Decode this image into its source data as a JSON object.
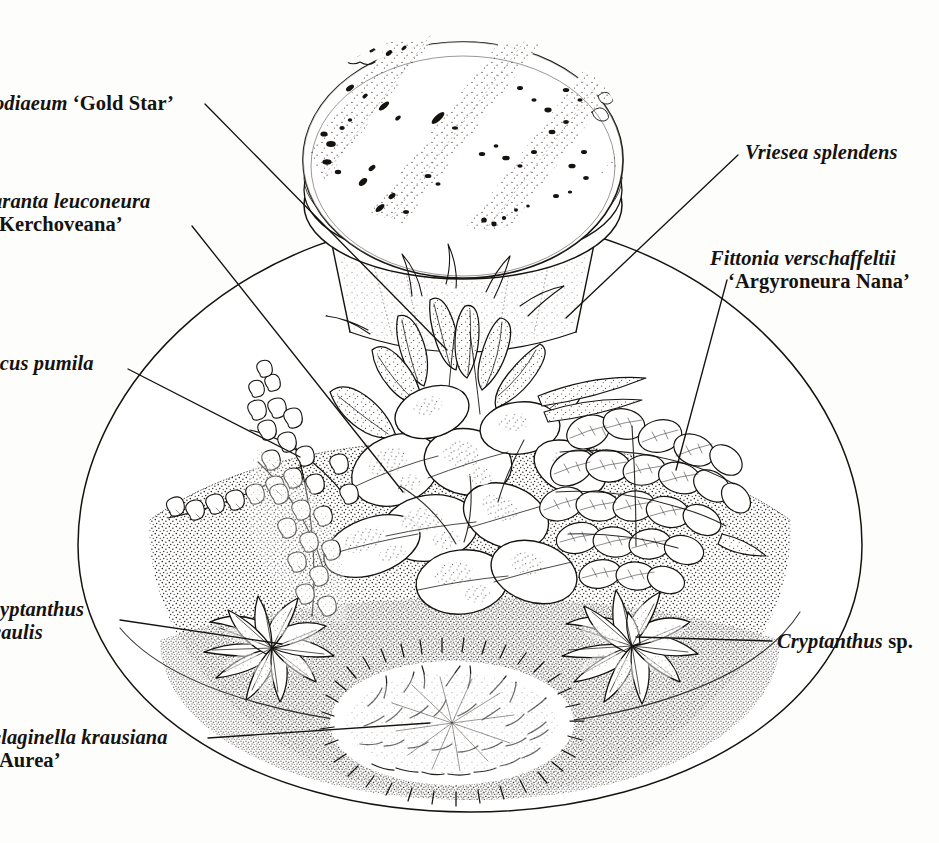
{
  "figure": {
    "kind": "botanical-line-illustration",
    "background_color": "#fdfdfc",
    "ink_color": "#16130f",
    "width": 939,
    "height": 843
  },
  "labels": [
    {
      "id": "codiaeum",
      "name": "label-codiaeum-gold-star",
      "genus_species": "odiaeum",
      "cultivar": "‘Gold Star’",
      "full_text": "odiaeum ‘Gold Star’",
      "truncated_left": true,
      "side": "left",
      "leader_from": [
        205,
        104
      ],
      "leader_to": [
        447,
        350
      ]
    },
    {
      "id": "maranta",
      "name": "label-maranta-leuconeura-kerchoveana",
      "genus_species": "aranta leuconeura",
      "cultivar": "‘Kerchoveana’",
      "full_text": "aranta leuconeura ‘Kerchoveana’",
      "truncated_left": true,
      "side": "left",
      "leader_from": [
        192,
        226
      ],
      "leader_to": [
        403,
        492
      ]
    },
    {
      "id": "ficus",
      "name": "label-ficus-pumila",
      "genus_species": "icus pumila",
      "cultivar": "",
      "full_text": "icus pumila",
      "truncated_left": true,
      "side": "left",
      "leader_from": [
        128,
        369
      ],
      "leader_to": [
        296,
        456
      ]
    },
    {
      "id": "cryptanthus-acaulis",
      "name": "label-cryptanthus-acaulis",
      "genus_species": "ryptanthus",
      "cultivar": "caulis",
      "full_text": "ryptanthus caulis",
      "truncated_left": true,
      "side": "left",
      "leader_from": [
        120,
        620
      ],
      "leader_to": [
        280,
        643
      ]
    },
    {
      "id": "selaginella",
      "name": "label-selaginella-krausiana-aurea",
      "genus_species": "elaginella krausiana",
      "cultivar": "‘Aurea’",
      "full_text": "elaginella krausiana ‘Aurea’",
      "truncated_left": true,
      "side": "left",
      "leader_from": [
        208,
        738
      ],
      "leader_to": [
        428,
        723
      ]
    },
    {
      "id": "vriesea",
      "name": "label-vriesea-splendens",
      "genus_species": "Vriesea splendens",
      "cultivar": "",
      "full_text": "Vriesea splendens",
      "truncated_left": false,
      "side": "right",
      "leader_from": [
        738,
        155
      ],
      "leader_to": [
        566,
        318
      ]
    },
    {
      "id": "fittonia",
      "name": "label-fittonia-verschaffeltii-argyroneura-nana",
      "genus_species": "Fittonia verschaffeltii",
      "cultivar": "‘Argyroneura Nana’",
      "full_text": "Fittonia verschaffeltii ‘Argyroneura Nana’",
      "truncated_left": false,
      "side": "right",
      "leader_from": [
        727,
        280
      ],
      "leader_to": [
        676,
        468
      ]
    },
    {
      "id": "cryptanthus-sp",
      "name": "label-cryptanthus-sp",
      "genus_species": "Cryptanthus",
      "cultivar": "sp.",
      "full_text": "Cryptanthus sp.",
      "truncated_left": false,
      "side": "right",
      "leader_from": [
        770,
        641
      ],
      "leader_to": [
        636,
        637
      ]
    }
  ],
  "drawing_parts": {
    "bottle_lid": "glass-bottle-neck-and-lid",
    "bowl": "large-glass-bowl-terrarium",
    "soil": "stippled-soil-surface",
    "plants": [
      "codiaeum-gold-star",
      "maranta-leuconeura-kerchoveana",
      "ficus-pumila",
      "cryptanthus-acaulis",
      "selaginella-krausiana-aurea",
      "vriesea-splendens",
      "fittonia-verschaffeltii-argyroneura-nana",
      "cryptanthus-sp"
    ]
  }
}
